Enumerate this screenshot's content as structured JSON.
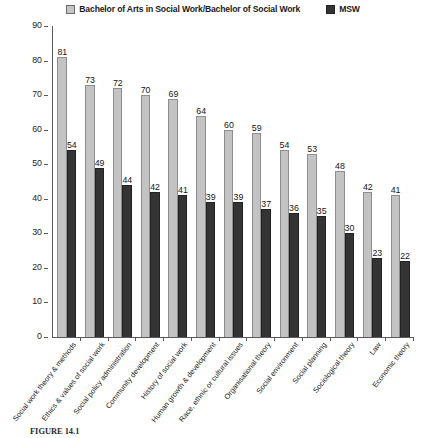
{
  "chart_data": {
    "type": "bar",
    "title": "",
    "xlabel": "",
    "ylabel": "",
    "ylim": [
      0,
      90
    ],
    "ytick_step": 10,
    "yticks": [
      90,
      80,
      70,
      60,
      50,
      40,
      30,
      20,
      10,
      0
    ],
    "grid": false,
    "legend_position": "top",
    "categories": [
      "Social work theory & methods",
      "Ethics & values of social work",
      "Social policy administration",
      "Community development",
      "History of social work",
      "Human growth & development",
      "Race, ethnic or cultural issues",
      "Organisational theory",
      "Social environment",
      "Social planning",
      "Sociological theory",
      "Law",
      "Economic theory"
    ],
    "series": [
      {
        "name": "Bachelor of Arts in Social Work/Bachelor of Social Work",
        "color": "#c3c3c3",
        "values": [
          81,
          73,
          72,
          70,
          69,
          64,
          60,
          59,
          54,
          53,
          48,
          42,
          41
        ]
      },
      {
        "name": "MSW",
        "color": "#343434",
        "values": [
          54,
          49,
          44,
          42,
          41,
          39,
          39,
          37,
          36,
          35,
          30,
          23,
          22
        ]
      }
    ]
  },
  "legend": {
    "entries": [
      {
        "label": "Bachelor of Arts in Social Work/Bachelor of Social Work",
        "swatch": "light-gray-square"
      },
      {
        "label": "MSW",
        "swatch": "dark-gray-square"
      }
    ]
  },
  "caption": {
    "prefix": "FIGURE 14.1",
    "text": ""
  }
}
